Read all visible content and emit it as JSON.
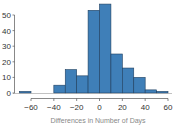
{
  "chart_data": {
    "type": "bar",
    "subtype": "histogram",
    "title": "",
    "xlabel": "Differences in Number of Days",
    "ylabel": "",
    "bin_edges": [
      -70,
      -60,
      -50,
      -40,
      -30,
      -20,
      -10,
      0,
      10,
      20,
      30,
      40,
      50,
      60
    ],
    "categories": [
      "-70 to -60",
      "-60 to -50",
      "-50 to -40",
      "-40 to -30",
      "-30 to -20",
      "-20 to -10",
      "-10 to 0",
      "0 to 10",
      "10 to 20",
      "20 to 30",
      "30 to 40",
      "40 to 50",
      "50 to 60"
    ],
    "values": [
      1,
      0,
      0,
      5,
      15,
      11,
      53,
      57,
      25,
      16,
      10,
      2,
      1
    ],
    "xlim": [
      -70,
      60
    ],
    "ylim": [
      0,
      57
    ],
    "x_ticks": [
      -60,
      -40,
      -20,
      0,
      20,
      40,
      60
    ],
    "y_ticks": [
      0,
      10,
      20,
      30,
      40,
      50
    ],
    "grid": false,
    "legend": null,
    "bar_color": "#3f7fb8",
    "edge_color": "#1f3f5f"
  }
}
